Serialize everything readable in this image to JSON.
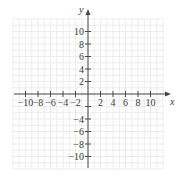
{
  "chart_data": {
    "type": "scatter",
    "title": "",
    "xlabel": "x",
    "ylabel": "y",
    "xlim": [
      -12,
      12
    ],
    "ylim": [
      -12,
      12
    ],
    "grid": true,
    "x_ticks": [
      -10,
      -8,
      -6,
      -4,
      -2,
      2,
      4,
      6,
      8,
      10
    ],
    "y_ticks": [
      10,
      8,
      6,
      4,
      2,
      -4,
      -6,
      -8,
      -10
    ],
    "x_tick_labels": [
      "−10",
      "−8",
      "−6",
      "−4",
      "−2",
      "2",
      "4",
      "6",
      "8",
      "10"
    ],
    "y_tick_labels_positive": [
      "10",
      "8",
      "6",
      "4",
      "2"
    ],
    "y_tick_labels_negative": [
      "−4",
      "−6",
      "−8",
      "−10"
    ],
    "points": []
  },
  "colors": {
    "axis": "#4a4a4a",
    "grid": "#ececec",
    "text": "#3a3a3a"
  }
}
